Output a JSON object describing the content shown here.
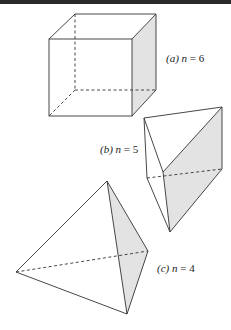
{
  "figure": {
    "background": "#ffffff",
    "line_color": "#333333",
    "shade_color": "#e3e3e3",
    "top_bar_color": "#2a2a2a",
    "shapes": [
      {
        "id": "cube",
        "label_prefix": "(a)",
        "label_var": "n",
        "label_eq": "= 6",
        "n": 6,
        "vertices": {
          "front_tl": [
            49,
            39
          ],
          "front_tr": [
            132,
            39
          ],
          "front_br": [
            132,
            116
          ],
          "front_bl": [
            49,
            116
          ],
          "back_tl": [
            75,
            14
          ],
          "back_tr": [
            156,
            14
          ],
          "back_br": [
            156,
            90
          ],
          "back_bl": [
            75,
            90
          ]
        }
      },
      {
        "id": "triangular-prism",
        "label_prefix": "(b)",
        "label_var": "n",
        "label_eq": "= 5",
        "n": 5,
        "vertices": {
          "top_left": [
            144,
            118
          ],
          "top_right": [
            222,
            107
          ],
          "top_front": [
            163,
            172
          ],
          "bottom_left": [
            147,
            178
          ],
          "bottom_right": [
            222,
            169
          ],
          "bottom_front": [
            170,
            232
          ]
        }
      },
      {
        "id": "tetrahedron",
        "label_prefix": "(c)",
        "label_var": "n",
        "label_eq": "= 4",
        "n": 4,
        "vertices": {
          "apex": [
            107,
            181
          ],
          "left": [
            16,
            272
          ],
          "right": [
            148,
            251
          ],
          "bottom": [
            127,
            314
          ]
        }
      }
    ]
  }
}
